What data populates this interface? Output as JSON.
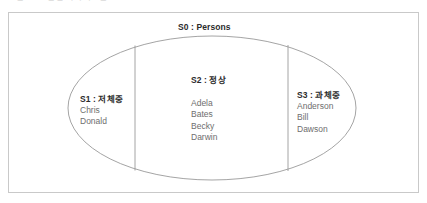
{
  "figure": {
    "caption_partial": "그림 4-12  집합 다이어그램"
  },
  "diagram": {
    "universe": {
      "id": "S0",
      "name": "Persons",
      "label": "S0 : Persons"
    },
    "partitions": [
      {
        "id": "S1",
        "name": "저체중",
        "label": "S1 : 저체중",
        "members": [
          "Chris",
          "Donald"
        ]
      },
      {
        "id": "S2",
        "name": "정상",
        "label": "S2 : 정상",
        "members": [
          "Adela",
          "Bates",
          "Becky",
          "Darwin"
        ]
      },
      {
        "id": "S3",
        "name": "과체중",
        "label": "S3 : 과체중",
        "members": [
          "Anderson",
          "Bill",
          "Dawson"
        ]
      }
    ]
  },
  "colors": {
    "background": "#ffffff",
    "frame_border": "#c9c9c9",
    "ellipse_stroke": "#9a9a9a",
    "divider_stroke": "#9a9a9a",
    "title_text": "#2b2b2b",
    "member_text": "#6e6e6e",
    "caption_text": "#8e8e8e"
  }
}
